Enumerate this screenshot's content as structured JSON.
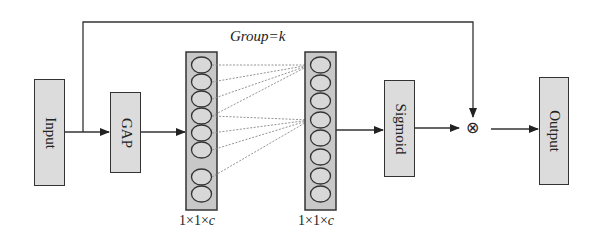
{
  "diagram": {
    "group_label": "Group=k",
    "nodes": {
      "input": "Input",
      "gap": "GAP",
      "sigmoid": "Sigmoid",
      "output": "Output"
    },
    "multiply_symbol": "⊗",
    "left_column_label_prefix": "1×1×",
    "right_column_label_prefix": "1×1×",
    "column_label_var": "c",
    "neurons_per_column": 8,
    "connections": [
      {
        "target": 1,
        "sources": [
          1,
          2,
          3,
          4
        ]
      },
      {
        "target": 4,
        "sources": [
          4,
          5,
          6,
          7
        ]
      }
    ],
    "colors": {
      "box_fill": "#dcdcdc",
      "column_fill": "#c8c8c8",
      "stroke": "#333333",
      "dotted": "#888888"
    }
  }
}
